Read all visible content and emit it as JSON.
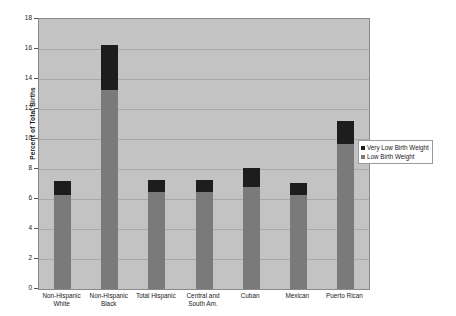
{
  "chart_data": {
    "type": "bar",
    "stacked": true,
    "title": "",
    "subtitle": "",
    "xlabel": "",
    "ylabel": "Percent of Total Births",
    "ylim": [
      0,
      18
    ],
    "ytick_step": 2,
    "ytick_labels": [
      "0",
      "2",
      "4",
      "6",
      "8",
      "10",
      "12",
      "14",
      "16",
      "18"
    ],
    "grid": true,
    "legend_position": "right",
    "categories": [
      "Non-Hispanic\nWhite",
      "Non-Hispanic\nBlack",
      "Total Hispanic",
      "Central and\nSouth Am.",
      "Cuban",
      "Mexican",
      "Puerto Rican"
    ],
    "series": [
      {
        "name": "Low Birth Weight",
        "color": "#7a7a7a",
        "values": [
          6.3,
          13.3,
          6.5,
          6.5,
          6.8,
          6.3,
          9.7
        ]
      },
      {
        "name": "Very Low Birth Weight",
        "color": "#1d1d1d",
        "values": [
          0.9,
          3.0,
          0.8,
          0.8,
          1.3,
          0.8,
          1.5
        ]
      }
    ],
    "totals": [
      7.2,
      16.3,
      7.3,
      7.3,
      8.1,
      7.1,
      11.2
    ],
    "plot_background": "#c3c3c3",
    "gridline_color": "#a9a9a9",
    "page_background": "#ffffff"
  },
  "legend": {
    "entries": [
      {
        "label": "Very Low Birth Weight",
        "color": "#1d1d1d"
      },
      {
        "label": "Low Birth Weight",
        "color": "#7a7a7a"
      }
    ]
  }
}
